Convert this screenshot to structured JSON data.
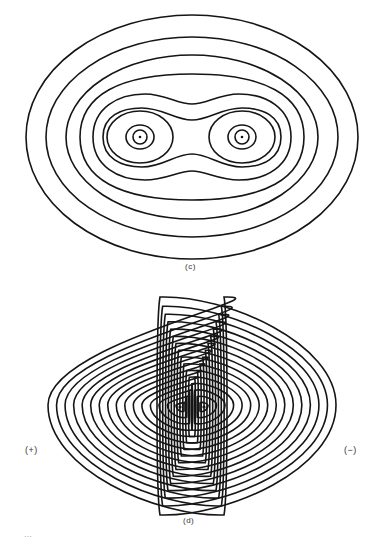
{
  "panels": [
    {
      "id": "c",
      "label": "(c)",
      "description": "Contour plot of electron density for a bonding (sigma) molecular orbital; two nuclei enclosed by merging contours",
      "nuclei": [
        {
          "x": 139.5,
          "y": 137
        },
        {
          "x": 242,
          "y": 137
        }
      ],
      "contour_count": 9
    },
    {
      "id": "d",
      "label": "(d)",
      "description": "Contour plot of an antibonding molecular orbital; two separate lobes of opposite phase with a nodal plane between",
      "lobes": [
        {
          "sign_label": "(+)",
          "center": {
            "x": 137,
            "y": 407
          },
          "contour_count": 16
        },
        {
          "sign_label": "(−)",
          "center": {
            "x": 247,
            "y": 407
          },
          "contour_count": 16
        }
      ]
    }
  ],
  "truncated_caption": "···"
}
